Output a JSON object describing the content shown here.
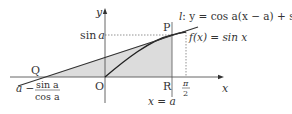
{
  "diagram": {
    "type": "function-graph-with-tangent",
    "colors": {
      "axis": "#555555",
      "curve": "#222222",
      "tangent": "#333333",
      "shade": "#d9d9d9",
      "dashed": "#666666",
      "text": "#333333"
    },
    "labels": {
      "y_axis": "y",
      "x_axis": "x",
      "origin": "O",
      "point_p": "P",
      "point_q": "Q",
      "point_r": "R",
      "sin_a": "sin a",
      "sin_a_sin": "sin",
      "sin_a_var": "a",
      "tangent_line": "l : y = cos a(x − a) + sin a",
      "tangent_l": "l",
      "tangent_eq": ": y = cos a(x − a) + sin a",
      "function": "f(x) = sin x",
      "pi_half_num": "π",
      "pi_half_den": "2",
      "x_eq_a": "x = a",
      "q_coord_prefix": "a −",
      "q_coord_num": "sin a",
      "q_coord_den": "cos a"
    },
    "points": {
      "O": [
        0,
        0
      ],
      "P": [
        "a",
        "sin a"
      ],
      "Q": [
        "a − sin a / cos a",
        0
      ],
      "R": [
        "a",
        0
      ]
    },
    "curves": [
      {
        "name": "f(x) = sin x",
        "domain": [
          0,
          "π/2"
        ]
      },
      {
        "name": "l: y = cos a(x − a) + sin a",
        "kind": "tangent at P"
      }
    ],
    "shaded_region": "triangle Q-R-P minus region under sin x from 0 to a (between tangent l, curve, and x-axis)"
  }
}
